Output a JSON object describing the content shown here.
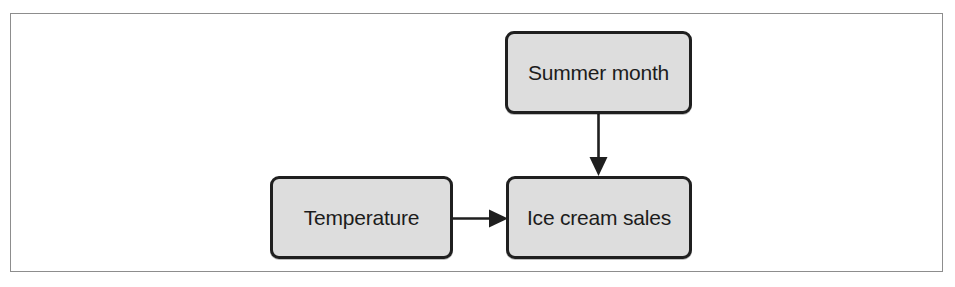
{
  "figure": {
    "type": "causal-diagram",
    "background_color": "#ffffff",
    "frame_color": "#8d8d8d",
    "node_fill_color": "#dddddd",
    "node_border_color": "#1f1f1f",
    "edge_color": "#1f1f1f"
  },
  "nodes": [
    {
      "id": "summer-month",
      "label": "Summer month"
    },
    {
      "id": "temperature",
      "label": "Temperature"
    },
    {
      "id": "ice-cream-sales",
      "label": "Ice cream sales"
    }
  ],
  "edges": [
    {
      "id": "summer-month-to-ice-cream-sales",
      "from": "summer-month",
      "to": "ice-cream-sales",
      "direction": "down",
      "arrowhead": "solid-triangle"
    },
    {
      "id": "temperature-to-ice-cream-sales",
      "from": "temperature",
      "to": "ice-cream-sales",
      "direction": "right",
      "arrowhead": "solid-triangle"
    }
  ]
}
